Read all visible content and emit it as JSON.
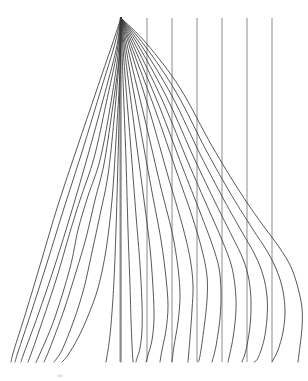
{
  "figure": {
    "type": "spaghetti-fan-plot",
    "title": "",
    "background_color": "#ffffff",
    "curve_color": "#3a3a3a",
    "reference_line_color": "#808080",
    "width": 308,
    "height": 381
  },
  "chart_data": {
    "type": "line",
    "title": "",
    "subtitle": "",
    "xlabel": "",
    "ylabel": "",
    "xlim": [
      0,
      308
    ],
    "ylim": [
      381,
      0
    ],
    "grid": false,
    "legend": "none",
    "annotations": [],
    "apex": {
      "x": 121,
      "y": 18
    },
    "baseline_y": 362,
    "reference_lines_x": [
      120,
      147,
      172,
      197,
      222,
      247,
      272
    ],
    "reference_line_top_y": 18,
    "series": [
      {
        "name": "trace-01",
        "values": [
          [
            121,
            18
          ],
          [
            112,
            45
          ],
          [
            96,
            92
          ],
          [
            77,
            148
          ],
          [
            58,
            205
          ],
          [
            41,
            262
          ],
          [
            26,
            312
          ],
          [
            14,
            350
          ],
          [
            11,
            362
          ]
        ]
      },
      {
        "name": "trace-02",
        "values": [
          [
            121,
            18
          ],
          [
            114,
            47
          ],
          [
            99,
            96
          ],
          [
            82,
            152
          ],
          [
            64,
            208
          ],
          [
            47,
            263
          ],
          [
            31,
            313
          ],
          [
            18,
            352
          ],
          [
            15,
            362
          ]
        ]
      },
      {
        "name": "trace-03",
        "values": [
          [
            121,
            18
          ],
          [
            116,
            50
          ],
          [
            103,
            100
          ],
          [
            88,
            155
          ],
          [
            72,
            210
          ],
          [
            55,
            265
          ],
          [
            38,
            315
          ],
          [
            24,
            353
          ],
          [
            21,
            362
          ]
        ]
      },
      {
        "name": "trace-04",
        "values": [
          [
            121,
            18
          ],
          [
            117,
            52
          ],
          [
            106,
            104
          ],
          [
            94,
            158
          ],
          [
            80,
            200
          ],
          [
            70,
            232
          ],
          [
            56,
            280
          ],
          [
            36,
            340
          ],
          [
            28,
            362
          ]
        ]
      },
      {
        "name": "trace-05",
        "values": [
          [
            121,
            18
          ],
          [
            118,
            55
          ],
          [
            110,
            108
          ],
          [
            100,
            160
          ],
          [
            88,
            196
          ],
          [
            78,
            230
          ],
          [
            70,
            268
          ],
          [
            54,
            320
          ],
          [
            38,
            358
          ],
          [
            36,
            362
          ]
        ]
      },
      {
        "name": "trace-06",
        "values": [
          [
            121,
            18
          ],
          [
            119,
            58
          ],
          [
            112,
            112
          ],
          [
            104,
            164
          ],
          [
            95,
            200
          ],
          [
            86,
            238
          ],
          [
            76,
            272
          ],
          [
            64,
            310
          ],
          [
            50,
            348
          ],
          [
            44,
            362
          ]
        ]
      },
      {
        "name": "trace-07",
        "values": [
          [
            121,
            18
          ],
          [
            119,
            62
          ],
          [
            114,
            120
          ],
          [
            108,
            175
          ],
          [
            100,
            215
          ],
          [
            92,
            252
          ],
          [
            84,
            288
          ],
          [
            74,
            320
          ],
          [
            62,
            350
          ],
          [
            54,
            362
          ]
        ]
      },
      {
        "name": "trace-08",
        "values": [
          [
            121,
            18
          ],
          [
            120,
            70
          ],
          [
            116,
            140
          ],
          [
            112,
            200
          ],
          [
            106,
            250
          ],
          [
            98,
            288
          ],
          [
            88,
            316
          ],
          [
            78,
            338
          ],
          [
            68,
            355
          ],
          [
            62,
            362
          ]
        ]
      },
      {
        "name": "trace-09",
        "values": [
          [
            121,
            18
          ],
          [
            120,
            80
          ],
          [
            118,
            160
          ],
          [
            116,
            230
          ],
          [
            114,
            280
          ],
          [
            112,
            312
          ],
          [
            110,
            335
          ],
          [
            108,
            350
          ],
          [
            106,
            362
          ]
        ]
      },
      {
        "name": "trace-10",
        "values": [
          [
            121,
            18
          ],
          [
            121,
            90
          ],
          [
            121,
            180
          ],
          [
            121,
            250
          ],
          [
            121,
            300
          ],
          [
            121,
            330
          ],
          [
            121,
            350
          ],
          [
            121,
            362
          ]
        ]
      },
      {
        "name": "trace-11",
        "values": [
          [
            121,
            18
          ],
          [
            123,
            80
          ],
          [
            126,
            160
          ],
          [
            128,
            230
          ],
          [
            130,
            285
          ],
          [
            131,
            320
          ],
          [
            132,
            345
          ],
          [
            133,
            362
          ]
        ]
      },
      {
        "name": "trace-12",
        "values": [
          [
            121,
            18
          ],
          [
            125,
            75
          ],
          [
            131,
            150
          ],
          [
            136,
            215
          ],
          [
            140,
            265
          ],
          [
            142,
            305
          ],
          [
            142,
            330
          ],
          [
            140,
            348
          ],
          [
            137,
            358
          ],
          [
            136,
            362
          ]
        ]
      },
      {
        "name": "trace-13",
        "values": [
          [
            121,
            18
          ],
          [
            127,
            70
          ],
          [
            136,
            140
          ],
          [
            144,
            200
          ],
          [
            150,
            248
          ],
          [
            153,
            288
          ],
          [
            154,
            318
          ],
          [
            152,
            340
          ],
          [
            148,
            355
          ],
          [
            146,
            362
          ]
        ]
      },
      {
        "name": "trace-14",
        "values": [
          [
            121,
            18
          ],
          [
            129,
            66
          ],
          [
            141,
            132
          ],
          [
            152,
            192
          ],
          [
            161,
            240
          ],
          [
            166,
            278
          ],
          [
            168,
            306
          ],
          [
            166,
            330
          ],
          [
            162,
            350
          ],
          [
            160,
            362
          ]
        ]
      },
      {
        "name": "trace-15",
        "values": [
          [
            121,
            18
          ],
          [
            131,
            62
          ],
          [
            146,
            124
          ],
          [
            160,
            184
          ],
          [
            172,
            232
          ],
          [
            178,
            268
          ],
          [
            180,
            296
          ],
          [
            178,
            322
          ],
          [
            174,
            346
          ],
          [
            172,
            362
          ]
        ]
      },
      {
        "name": "trace-16",
        "values": [
          [
            121,
            18
          ],
          [
            133,
            58
          ],
          [
            151,
            116
          ],
          [
            168,
            176
          ],
          [
            182,
            224
          ],
          [
            190,
            258
          ],
          [
            193,
            285
          ],
          [
            192,
            310
          ],
          [
            190,
            338
          ],
          [
            188,
            362
          ]
        ]
      },
      {
        "name": "trace-17",
        "values": [
          [
            121,
            18
          ],
          [
            135,
            56
          ],
          [
            156,
            112
          ],
          [
            176,
            170
          ],
          [
            192,
            216
          ],
          [
            202,
            250
          ],
          [
            207,
            276
          ],
          [
            207,
            300
          ],
          [
            204,
            328
          ],
          [
            200,
            356
          ],
          [
            198,
            362
          ]
        ]
      },
      {
        "name": "trace-18",
        "values": [
          [
            121,
            18
          ],
          [
            137,
            54
          ],
          [
            160,
            108
          ],
          [
            182,
            166
          ],
          [
            200,
            212
          ],
          [
            212,
            244
          ],
          [
            219,
            268
          ],
          [
            221,
            292
          ],
          [
            220,
            318
          ],
          [
            216,
            346
          ],
          [
            212,
            362
          ]
        ]
      },
      {
        "name": "trace-19",
        "values": [
          [
            121,
            18
          ],
          [
            139,
            52
          ],
          [
            164,
            104
          ],
          [
            188,
            162
          ],
          [
            208,
            208
          ],
          [
            222,
            240
          ],
          [
            231,
            264
          ],
          [
            235,
            286
          ],
          [
            236,
            310
          ],
          [
            233,
            338
          ],
          [
            228,
            362
          ]
        ]
      },
      {
        "name": "trace-20",
        "values": [
          [
            121,
            18
          ],
          [
            141,
            50
          ],
          [
            168,
            100
          ],
          [
            194,
            158
          ],
          [
            216,
            204
          ],
          [
            232,
            236
          ],
          [
            243,
            259
          ],
          [
            249,
            280
          ],
          [
            251,
            302
          ],
          [
            250,
            326
          ],
          [
            246,
            350
          ],
          [
            242,
            362
          ]
        ]
      },
      {
        "name": "trace-21",
        "values": [
          [
            121,
            18
          ],
          [
            143,
            48
          ],
          [
            172,
            96
          ],
          [
            200,
            154
          ],
          [
            224,
            200
          ],
          [
            242,
            232
          ],
          [
            255,
            255
          ],
          [
            263,
            275
          ],
          [
            267,
            296
          ],
          [
            267,
            318
          ],
          [
            264,
            340
          ],
          [
            258,
            358
          ],
          [
            254,
            362
          ]
        ]
      },
      {
        "name": "trace-22",
        "values": [
          [
            121,
            18
          ],
          [
            145,
            46
          ],
          [
            176,
            92
          ],
          [
            206,
            150
          ],
          [
            232,
            196
          ],
          [
            252,
            228
          ],
          [
            267,
            251
          ],
          [
            277,
            271
          ],
          [
            283,
            291
          ],
          [
            285,
            312
          ],
          [
            283,
            332
          ],
          [
            278,
            350
          ],
          [
            272,
            362
          ]
        ]
      },
      {
        "name": "trace-23",
        "values": [
          [
            121,
            18
          ],
          [
            147,
            44
          ],
          [
            180,
            88
          ],
          [
            212,
            146
          ],
          [
            240,
            192
          ],
          [
            262,
            224
          ],
          [
            279,
            247
          ],
          [
            291,
            267
          ],
          [
            298,
            288
          ],
          [
            302,
            308
          ],
          [
            302,
            328
          ],
          [
            300,
            346
          ],
          [
            298,
            362
          ]
        ]
      }
    ]
  }
}
